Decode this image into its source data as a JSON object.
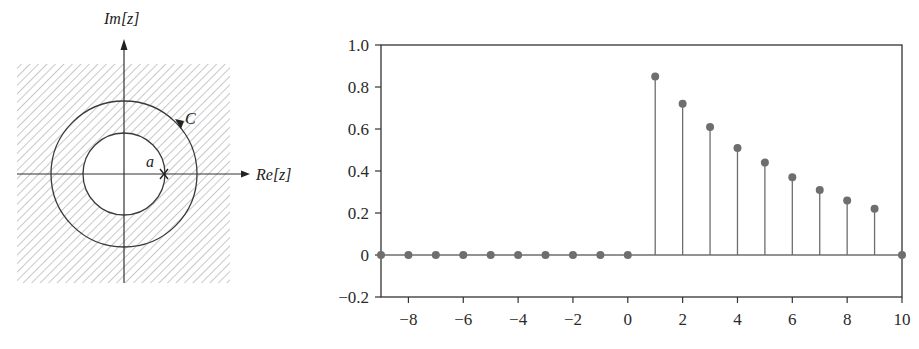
{
  "figure": {
    "left_panel": {
      "type": "z-plane region of convergence diagram",
      "axis_labels": {
        "imag": "Im[z]",
        "real": "Re[z]"
      },
      "contour_label": "C",
      "pole_label": "a",
      "pole_marker": "×",
      "shading": "hatched region outside inner circle"
    },
    "right_panel": {
      "y_ticks": [
        "1.0",
        "0.8",
        "0.6",
        "0.4",
        "0.2",
        "0",
        "−0.2"
      ],
      "x_ticks": [
        "−8",
        "−6",
        "−4",
        "−2",
        "0",
        "2",
        "4",
        "6",
        "8",
        "10"
      ]
    }
  },
  "chart_data": {
    "type": "stem",
    "title": "",
    "xlabel": "",
    "ylabel": "",
    "xlim": [
      -9,
      10
    ],
    "ylim": [
      -0.2,
      1.0
    ],
    "grid": false,
    "legend": null,
    "x": [
      -9,
      -8,
      -7,
      -6,
      -5,
      -4,
      -3,
      -2,
      -1,
      0,
      1,
      2,
      3,
      4,
      5,
      6,
      7,
      8,
      9,
      10
    ],
    "values": [
      0,
      0,
      0,
      0,
      0,
      0,
      0,
      0,
      0,
      0,
      0.85,
      0.72,
      0.61,
      0.51,
      0.44,
      0.37,
      0.31,
      0.26,
      0.22,
      0
    ],
    "x_tick_labels": [
      "-8",
      "-6",
      "-4",
      "-2",
      "0",
      "2",
      "4",
      "6",
      "8",
      "10"
    ],
    "y_tick_labels": [
      "1.0",
      "0.8",
      "0.6",
      "0.4",
      "0.2",
      "0",
      "-0.2"
    ],
    "marker_color": "#6e6e6e",
    "line_color": "#6e6e6e"
  }
}
